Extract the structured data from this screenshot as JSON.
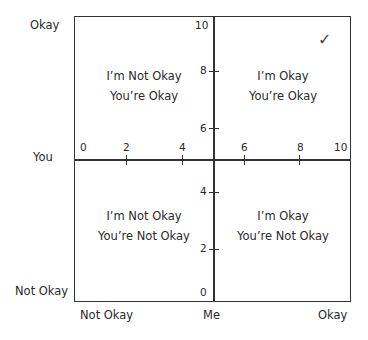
{
  "diagram": {
    "title": "",
    "y_axis": {
      "top_label": "Okay",
      "middle_label": "You",
      "bottom_label": "Not Okay"
    },
    "x_axis": {
      "left_label": "Not Okay",
      "middle_label": "Me",
      "right_label": "Okay"
    },
    "horizontal_ticks": [
      "0",
      "2",
      "4",
      "6",
      "8",
      "10"
    ],
    "vertical_ticks": [
      "10",
      "8",
      "6",
      "4",
      "2",
      "0"
    ],
    "quadrants": [
      {
        "position": "top-left",
        "line1": "I’m Not Okay",
        "line2": "You’re Okay"
      },
      {
        "position": "top-right",
        "line1": "I’m Okay",
        "line2": "You’re Okay"
      },
      {
        "position": "bottom-left",
        "line1": "I’m Not Okay",
        "line2": "You’re Not Okay"
      },
      {
        "position": "bottom-right",
        "line1": "I’m Okay",
        "line2": "You’re Not Okay"
      }
    ],
    "check_mark": "✓"
  }
}
